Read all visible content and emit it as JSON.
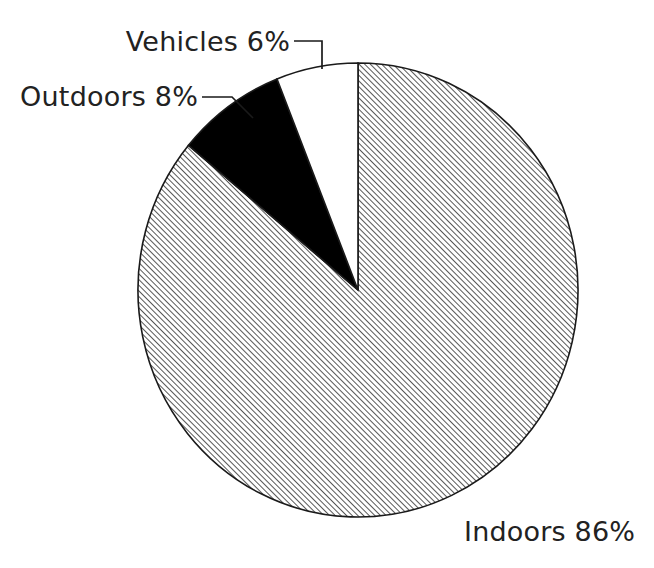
{
  "chart_data": {
    "type": "pie",
    "title": "",
    "subtitle": "",
    "xlabel": "",
    "ylabel": "",
    "legend_position": "none",
    "grid": false,
    "unit": "%",
    "start_angle_deg": 90,
    "direction": "clockwise",
    "categories": [
      "Indoors",
      "Outdoors",
      "Vehicles"
    ],
    "values": [
      86,
      8,
      6
    ],
    "labels": [
      "Indoors 86%",
      "Outdoors 8%",
      "Vehicles 6%"
    ],
    "slices": [
      {
        "name": "Indoors",
        "value": 86,
        "label": "Indoors 86%",
        "fill_style": "diagonal-hatch",
        "fill_color": "#ffffff",
        "hatch_color": "#3a3a3a",
        "outline_color": "#1a1a1a",
        "label_x": 464,
        "label_y": 541,
        "label_anchor": "start",
        "has_leader": false
      },
      {
        "name": "Outdoors",
        "value": 8,
        "label": "Outdoors 8%",
        "fill_style": "solid",
        "fill_color": "#000000",
        "hatch_color": "#000000",
        "outline_color": "#1a1a1a",
        "label_x": 198,
        "label_y": 106,
        "label_anchor": "end",
        "has_leader": true,
        "leader_points": "202,97 232,97 253,118"
      },
      {
        "name": "Vehicles",
        "value": 6,
        "label": "Vehicles 6%",
        "fill_style": "solid",
        "fill_color": "#ffffff",
        "hatch_color": "#ffffff",
        "outline_color": "#1a1a1a",
        "label_x": 290,
        "label_y": 51,
        "label_anchor": "end",
        "has_leader": true,
        "leader_points": "294,41 322,41 322,69"
      }
    ],
    "geometry": {
      "center_x": 358,
      "center_y": 290,
      "radius_x": 220,
      "radius_y": 227
    }
  },
  "colors": {
    "background": "#ffffff",
    "outline": "#1a1a1a",
    "text": "#222222",
    "solid_slice": "#000000",
    "hatch": "#3a3a3a"
  }
}
